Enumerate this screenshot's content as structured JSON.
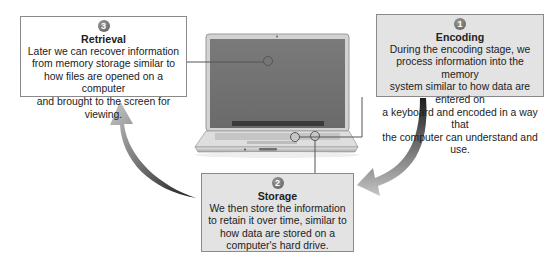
{
  "diagram": {
    "stages": [
      {
        "number": "1",
        "title": "Encoding",
        "description": "During the encoding stage, we\nprocess information into the memory\nsystem similar to how data are entered on\na keyboard and encoded in a way that\nthe computer can understand and use."
      },
      {
        "number": "2",
        "title": "Storage",
        "description": "We then store the information\nto retain it over time, similar to\nhow data are stored on a\ncomputer's hard drive."
      },
      {
        "number": "3",
        "title": "Retrieval",
        "description": "Later we can recover information\nfrom memory storage similar to\nhow files are opened on a computer\nand brought to the screen for viewing."
      }
    ],
    "center_image": "laptop-illustration",
    "arrows": [
      "encoding-to-storage",
      "storage-to-retrieval"
    ]
  }
}
